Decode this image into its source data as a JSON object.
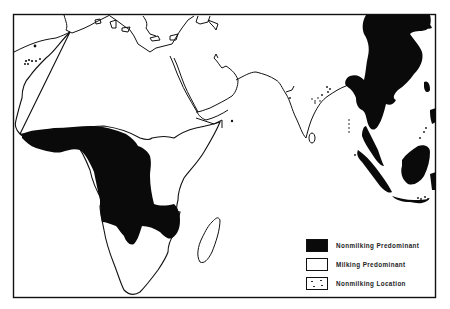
{
  "map": {
    "title": "",
    "colors": {
      "nonmilking": "#0a0a0a",
      "milking": "#ffffff",
      "outline": "#111111"
    },
    "regions_shown": [
      "Africa",
      "Arabian Peninsula",
      "Indian Subcontinent",
      "East Asia",
      "Southeast Asia",
      "Madagascar",
      "Mediterranean"
    ]
  },
  "legend": {
    "items": [
      {
        "label": "Nonmilking Predominant",
        "swatch": "black"
      },
      {
        "label": "Milking Predominant",
        "swatch": "white"
      },
      {
        "label": "Nonmilking Location",
        "swatch": "dots"
      }
    ]
  }
}
